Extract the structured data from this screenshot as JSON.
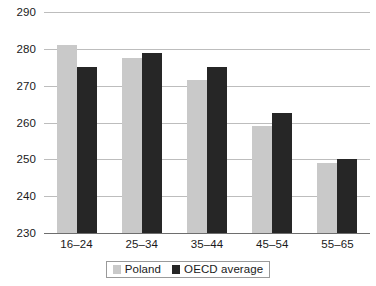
{
  "chart_data": {
    "type": "bar",
    "title": "",
    "subtitle": "",
    "xlabel": "",
    "ylabel": "",
    "categories": [
      "16–24",
      "25–34",
      "35–44",
      "45–54",
      "55–65"
    ],
    "series": [
      {
        "name": "Poland",
        "color": "#c9c9c9",
        "values": [
          281,
          277.5,
          271.5,
          259,
          249
        ]
      },
      {
        "name": "OECD average",
        "color": "#262626",
        "values": [
          275,
          279,
          275,
          262.5,
          250
        ]
      }
    ],
    "ylim": [
      230,
      290
    ],
    "ytick_step": 10,
    "ytick_labels": [
      "290",
      "280",
      "270",
      "260",
      "250",
      "240",
      "230"
    ],
    "ytick_values": [
      290,
      280,
      270,
      260,
      250,
      240,
      230
    ],
    "grid": true,
    "grid_axis": "y",
    "legend_position": "bottom-center",
    "legend_entries": [
      "Poland",
      "OECD average"
    ],
    "annotations": []
  },
  "legend": {
    "items": [
      {
        "label": "Poland",
        "swatch": "poland-swatch"
      },
      {
        "label": "OECD average",
        "swatch": "oecd-swatch"
      }
    ]
  }
}
